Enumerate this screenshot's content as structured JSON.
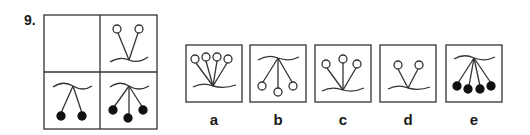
{
  "question": {
    "number": "9."
  },
  "colors": {
    "stroke": "#333333",
    "fill_dark": "#111111",
    "background": "#ffffff"
  },
  "matrix": {
    "cells": [
      {
        "position": "top-left",
        "content": "empty"
      },
      {
        "position": "top-right",
        "stems": 2,
        "direction": "up",
        "balls": "hollow"
      },
      {
        "position": "bottom-left",
        "stems": 2,
        "direction": "down",
        "balls": "filled"
      },
      {
        "position": "bottom-right",
        "stems": 3,
        "direction": "down",
        "balls": "filled"
      }
    ]
  },
  "options": [
    {
      "label": "a",
      "stems": 4,
      "direction": "up",
      "balls": "hollow"
    },
    {
      "label": "b",
      "stems": 3,
      "direction": "down",
      "balls": "hollow"
    },
    {
      "label": "c",
      "stems": 3,
      "direction": "up",
      "balls": "hollow"
    },
    {
      "label": "d",
      "stems": 2,
      "direction": "up",
      "balls": "hollow"
    },
    {
      "label": "e",
      "stems": 4,
      "direction": "down",
      "balls": "filled"
    }
  ]
}
